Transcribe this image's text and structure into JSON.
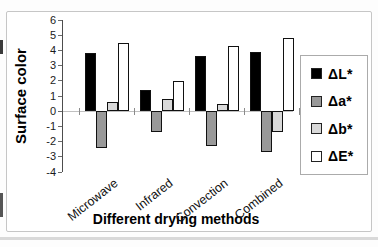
{
  "chart_data": {
    "type": "bar",
    "title": "",
    "xlabel": "Different drying methods",
    "ylabel": "Surface color",
    "categories": [
      "Microwave",
      "Infrared",
      "Convection",
      "Combined"
    ],
    "series": [
      {
        "name": "ΔL*",
        "color": "#000000",
        "values": [
          3.8,
          1.4,
          3.6,
          3.9
        ]
      },
      {
        "name": "Δa*",
        "color": "#999999",
        "values": [
          -2.4,
          -1.4,
          -2.3,
          -2.7
        ]
      },
      {
        "name": "Δb*",
        "color": "#d9d9d9",
        "values": [
          0.6,
          0.8,
          0.5,
          -1.4
        ]
      },
      {
        "name": "ΔE*",
        "color": "#ffffff",
        "values": [
          4.5,
          2.0,
          4.3,
          4.8
        ]
      }
    ],
    "ylim": [
      -4,
      6
    ],
    "ytick_step": 1,
    "grid": false,
    "legend_position": "right"
  }
}
